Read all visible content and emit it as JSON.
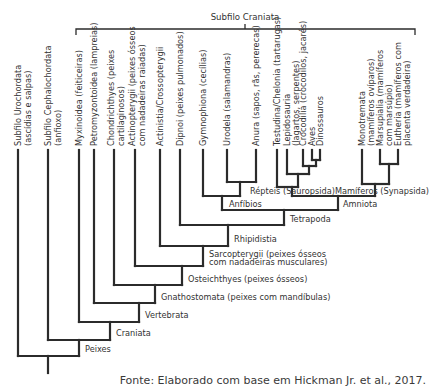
{
  "diagram": {
    "title": "Subfilo Craniata",
    "leaves": [
      {
        "id": "urochordata",
        "lines": [
          "Subfilo Urochordata",
          "(ascídias e salpas)"
        ]
      },
      {
        "id": "cephalochordata",
        "lines": [
          "Subfilo Cephalochordata",
          "(anfioxo)"
        ]
      },
      {
        "id": "myxinoidea",
        "lines": [
          "Myxinoidea (feiticeiras)"
        ]
      },
      {
        "id": "petromyzontoidea",
        "lines": [
          "Petromyzontoidea (lampreias)"
        ]
      },
      {
        "id": "chondrichthyes",
        "lines": [
          "Chondrichthyes (peixes",
          "cartilaginosos)"
        ]
      },
      {
        "id": "actinopterygii",
        "lines": [
          "Actinopterygii (peixes ósseos",
          "com nadadeiras raiadas)"
        ]
      },
      {
        "id": "actinistia",
        "lines": [
          "Actinistia/Crossopterygii"
        ]
      },
      {
        "id": "dipnoi",
        "lines": [
          "Dipnoi (peixes pulmonados)"
        ]
      },
      {
        "id": "gymnophiona",
        "lines": [
          "Gymnophiona (cecílias)"
        ]
      },
      {
        "id": "urodela",
        "lines": [
          "Urodela (salamandras)"
        ]
      },
      {
        "id": "anura",
        "lines": [
          "Anura (sapos, rãs, pererecas)"
        ]
      },
      {
        "id": "testudina",
        "lines": [
          "Testudina/Chelonia (tartarugas)"
        ]
      },
      {
        "id": "lepidosauria",
        "lines": [
          "Lepidosauria",
          "(lagartos, serpentes)"
        ]
      },
      {
        "id": "crocodilia",
        "lines": [
          "Crocodilia (crocodilos, jacarés)"
        ]
      },
      {
        "id": "aves",
        "lines": [
          "Aves"
        ]
      },
      {
        "id": "dinossauros",
        "lines": [
          "Dinossauros"
        ]
      },
      {
        "id": "monotremata",
        "lines": [
          "Monotremata",
          "(mamíferos ovíparos)"
        ]
      },
      {
        "id": "marsupialia",
        "lines": [
          "Marsupialia (mamíferos",
          "com marsúpio)"
        ]
      },
      {
        "id": "eutheria",
        "lines": [
          "Eutheria (mamíferos com",
          "placenta verdadeira)"
        ]
      }
    ],
    "nodes": {
      "repteis": "Répteis (Sauropsida)",
      "mamiferos": "Mamíferos (Synapsida)",
      "anfibios": "Anfíbios",
      "amniota": "Amniota",
      "tetrapoda": "Tetrapoda",
      "rhipidistia": "Rhipidistia",
      "sarcopterygii_1": "Sarcopterygii (peixes ósseos",
      "sarcopterygii_2": "com nadadeiras musculares)",
      "osteichthyes": "Osteichthyes (peixes ósseos)",
      "gnathostomata": "Gnathostomata (peixes com mandíbulas)",
      "vertebrata": "Vertebrata",
      "craniata": "Craniata",
      "peixes": "Peixes"
    },
    "source": "Fonte: Elaborado com base em Hickman Jr. et al., 2017."
  }
}
